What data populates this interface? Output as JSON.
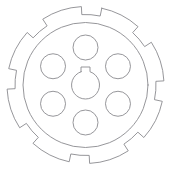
{
  "image": {
    "kind": "technical-line-drawing",
    "subject": "toothed flange hub with six bolt holes and keyed central bore",
    "background_color": "#ffffff",
    "line_color": "#8a8a8f",
    "line_width": 0.9,
    "width": 170,
    "height": 171
  },
  "geometry": {
    "center": {
      "x": 85.5,
      "y": 85.0
    },
    "outer_flange": {
      "name": "toothed-outer-flange",
      "outer_radius": 78.5,
      "root_radius": 70.5,
      "tooth_count": 8,
      "tooth_angular_width_deg": 30,
      "start_angle_deg": -78
    },
    "inner_disc": {
      "name": "inner-disc-rim",
      "radius": 62.5
    },
    "bolt_holes": {
      "name": "bolt-hole-circle",
      "count": 6,
      "bolt_circle_radius": 37.5,
      "hole_radius": 12.5,
      "angles_deg": [
        270,
        330,
        30,
        90,
        150,
        210
      ]
    },
    "center_bore": {
      "name": "center-bore",
      "radius": 14.0,
      "keyway": {
        "width": 9.0,
        "height": 9.5,
        "position": "top"
      }
    }
  },
  "labels": {
    "outer_flange": "Toothed outer flange",
    "inner_disc": "Inner disc rim",
    "bolt_holes": "Bolt hole pattern (6)",
    "center_bore": "Keyed center bore"
  }
}
